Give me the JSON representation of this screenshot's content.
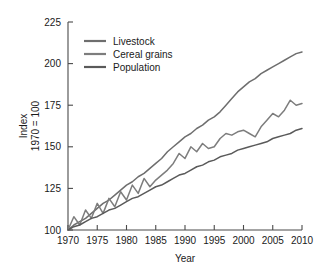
{
  "chart_data": {
    "type": "line",
    "title": "",
    "xlabel": "Year",
    "ylabel": "Index\n1970 = 100",
    "ylabel_line1": "Index",
    "ylabel_line2": "1970 = 100",
    "xlim": [
      1970,
      2010
    ],
    "ylim": [
      100,
      225
    ],
    "xticks": [
      1970,
      1975,
      1980,
      1985,
      1990,
      1995,
      2000,
      2005,
      2010
    ],
    "yticks": [
      100,
      125,
      150,
      175,
      200,
      225
    ],
    "xtick_labels": [
      "1970",
      "1975",
      "1980",
      "1985",
      "1990",
      "1995",
      "2000",
      "2005",
      "2010"
    ],
    "ytick_labels": [
      "100",
      "125",
      "150",
      "175",
      "200",
      "225"
    ],
    "grid": false,
    "legend_position": "upper-left-inside",
    "x": [
      1970,
      1971,
      1972,
      1973,
      1974,
      1975,
      1976,
      1977,
      1978,
      1979,
      1980,
      1981,
      1982,
      1983,
      1984,
      1985,
      1986,
      1987,
      1988,
      1989,
      1990,
      1991,
      1992,
      1993,
      1994,
      1995,
      1996,
      1997,
      1998,
      1999,
      2000,
      2001,
      2002,
      2003,
      2004,
      2005,
      2006,
      2007,
      2008,
      2009,
      2010
    ],
    "series": [
      {
        "name": "Livestock",
        "color": "#6e6e6e",
        "values": [
          100,
          103,
          105,
          107,
          110,
          113,
          116,
          118,
          121,
          124,
          127,
          129,
          132,
          134,
          137,
          140,
          143,
          147,
          150,
          153,
          156,
          158,
          161,
          163,
          166,
          168,
          171,
          175,
          179,
          183,
          186,
          189,
          191,
          194,
          196,
          198,
          200,
          202,
          204,
          206,
          207
        ]
      },
      {
        "name": "Cereal grains",
        "color": "#7d7d7d",
        "values": [
          100,
          108,
          103,
          112,
          107,
          116,
          110,
          119,
          114,
          123,
          118,
          127,
          122,
          131,
          126,
          130,
          133,
          136,
          140,
          146,
          143,
          150,
          147,
          152,
          149,
          150,
          155,
          158,
          157,
          159,
          160,
          158,
          156,
          162,
          166,
          170,
          168,
          172,
          178,
          175,
          176
        ]
      },
      {
        "name": "Population",
        "color": "#5a5a5a",
        "values": [
          100,
          102,
          103,
          105,
          107,
          108,
          110,
          112,
          113,
          115,
          117,
          119,
          120,
          122,
          124,
          126,
          127,
          129,
          131,
          133,
          134,
          136,
          138,
          139,
          141,
          142,
          144,
          145,
          146,
          148,
          149,
          150,
          151,
          152,
          153,
          155,
          156,
          157,
          158,
          160,
          161
        ]
      }
    ]
  },
  "legend": {
    "items": [
      {
        "label": "Livestock"
      },
      {
        "label": "Cereal grains"
      },
      {
        "label": "Population"
      }
    ]
  },
  "axes": {
    "x_title": "Year",
    "y_title_line1": "Index",
    "y_title_line2": "1970 = 100"
  }
}
